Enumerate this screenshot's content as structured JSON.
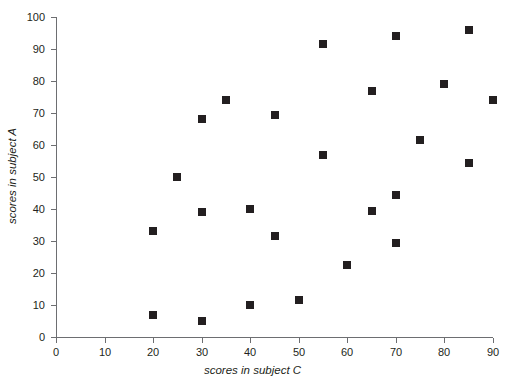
{
  "chart_data": {
    "type": "scatter",
    "title": "",
    "xlabel": "scores in subject C",
    "ylabel": "scores in subject A",
    "xlim": [
      0,
      90
    ],
    "ylim": [
      0,
      100
    ],
    "xticks": [
      0,
      10,
      20,
      30,
      40,
      50,
      60,
      70,
      80,
      90
    ],
    "yticks": [
      0,
      10,
      20,
      30,
      40,
      50,
      60,
      70,
      80,
      90,
      100
    ],
    "grid": false,
    "legend": false,
    "marker": "square",
    "marker_color": "#231f20",
    "points": [
      {
        "x": 20,
        "y": 33
      },
      {
        "x": 20,
        "y": 7
      },
      {
        "x": 25,
        "y": 50
      },
      {
        "x": 30,
        "y": 68
      },
      {
        "x": 30,
        "y": 39
      },
      {
        "x": 30,
        "y": 5
      },
      {
        "x": 35,
        "y": 74
      },
      {
        "x": 40,
        "y": 40
      },
      {
        "x": 40,
        "y": 10
      },
      {
        "x": 45,
        "y": 69.5
      },
      {
        "x": 45,
        "y": 31.5
      },
      {
        "x": 50,
        "y": 11.5
      },
      {
        "x": 55,
        "y": 91.5
      },
      {
        "x": 55,
        "y": 57
      },
      {
        "x": 60,
        "y": 22.5
      },
      {
        "x": 65,
        "y": 77
      },
      {
        "x": 65,
        "y": 39.5
      },
      {
        "x": 70,
        "y": 94
      },
      {
        "x": 70,
        "y": 44.5
      },
      {
        "x": 70,
        "y": 29.5
      },
      {
        "x": 75,
        "y": 61.5
      },
      {
        "x": 80,
        "y": 79
      },
      {
        "x": 85,
        "y": 96
      },
      {
        "x": 85,
        "y": 54.5
      },
      {
        "x": 90,
        "y": 74
      }
    ]
  }
}
